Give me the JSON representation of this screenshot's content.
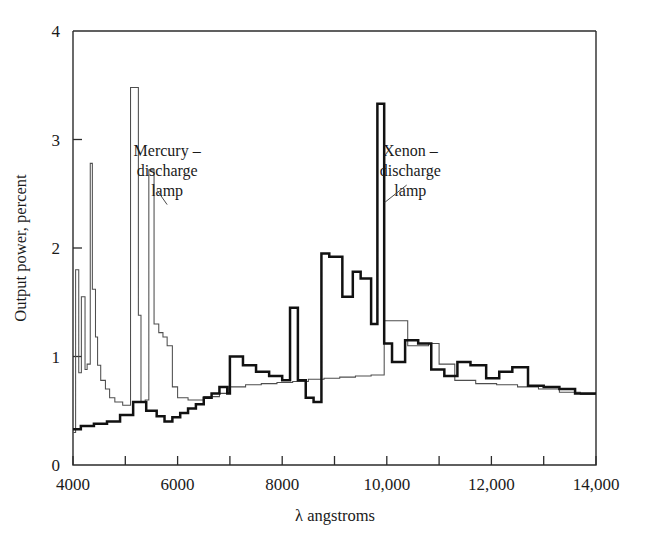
{
  "chart_data": {
    "type": "line",
    "title": "",
    "xlabel": "λ angstroms",
    "ylabel": "Output power, percent",
    "xlim": [
      4000,
      14000
    ],
    "ylim": [
      0,
      4
    ],
    "grid": false,
    "legend_position": "inline-annotations",
    "xticks": [
      4000,
      5000,
      6000,
      7000,
      8000,
      9000,
      10000,
      11000,
      12000,
      13000,
      14000
    ],
    "xtick_labels": [
      "4000",
      "",
      "6000",
      "",
      "8000",
      "",
      "10,000",
      "",
      "12,000",
      "",
      "14,000"
    ],
    "yticks": [
      0,
      1,
      2,
      3,
      4
    ],
    "ytick_labels": [
      "0",
      "1",
      "2",
      "3",
      "4"
    ],
    "annotations": [
      {
        "name": "mercury-label",
        "text_lines": [
          "Mercury –",
          "discharge",
          "lamp"
        ],
        "x": 5800,
        "y": 2.85
      },
      {
        "name": "xenon-label",
        "text_lines": [
          "Xenon –",
          "discharge",
          "lamp"
        ],
        "x": 10450,
        "y": 2.85
      }
    ],
    "series": [
      {
        "name": "Mercury-discharge lamp",
        "style": "thin",
        "color": "#4e4e4e",
        "x": [
          4000,
          4050,
          4050,
          4110,
          4110,
          4160,
          4160,
          4230,
          4230,
          4270,
          4270,
          4330,
          4330,
          4370,
          4370,
          4430,
          4430,
          4470,
          4470,
          4530,
          4530,
          4620,
          4620,
          4700,
          4700,
          4800,
          4800,
          4950,
          4950,
          5100,
          5100,
          5250,
          5250,
          5300,
          5300,
          5380,
          5380,
          5450,
          5450,
          5550,
          5550,
          5640,
          5640,
          5720,
          5720,
          5800,
          5800,
          5900,
          5900,
          6000,
          6000,
          6200,
          6200,
          6500,
          6500,
          6800,
          6800,
          7000,
          7000,
          7300,
          7300,
          7600,
          7600,
          7900,
          7900,
          8200,
          8200,
          8500,
          8500,
          8800,
          8800,
          9100,
          9100,
          9400,
          9400,
          9700,
          9700,
          9950,
          9950,
          10000,
          10000,
          10400,
          10400,
          10800,
          10800,
          11000,
          11000,
          11300,
          11300,
          11700,
          11700,
          12100,
          12100,
          12500,
          12500,
          12900,
          12900,
          13300,
          13300,
          13700,
          13700,
          14000
        ],
        "y": [
          0.3,
          0.3,
          1.8,
          1.8,
          0.85,
          0.85,
          1.55,
          1.55,
          0.88,
          0.88,
          0.93,
          0.93,
          2.78,
          2.78,
          1.62,
          1.62,
          1.18,
          1.18,
          0.92,
          0.92,
          0.78,
          0.78,
          0.7,
          0.7,
          0.62,
          0.62,
          0.58,
          0.58,
          0.55,
          0.55,
          3.48,
          3.48,
          1.38,
          1.38,
          0.58,
          0.58,
          0.6,
          0.6,
          2.72,
          2.72,
          1.3,
          1.3,
          1.22,
          1.22,
          1.18,
          1.18,
          1.1,
          1.1,
          0.72,
          0.72,
          0.62,
          0.62,
          0.6,
          0.6,
          0.63,
          0.63,
          0.66,
          0.66,
          0.72,
          0.72,
          0.74,
          0.74,
          0.75,
          0.75,
          0.76,
          0.76,
          0.77,
          0.77,
          0.79,
          0.79,
          0.8,
          0.8,
          0.81,
          0.81,
          0.82,
          0.82,
          0.83,
          0.83,
          1.33,
          1.33,
          1.33,
          1.33,
          1.1,
          1.1,
          1.12,
          1.12,
          0.93,
          0.93,
          0.78,
          0.78,
          0.75,
          0.75,
          0.74,
          0.74,
          0.72,
          0.72,
          0.7,
          0.7,
          0.67,
          0.67,
          0.65,
          0.65
        ]
      },
      {
        "name": "Xenon-discharge lamp",
        "style": "thick",
        "color": "#111111",
        "x": [
          4000,
          4150,
          4150,
          4400,
          4400,
          4650,
          4650,
          4900,
          4900,
          5150,
          5150,
          5400,
          5400,
          5600,
          5600,
          5750,
          5750,
          5900,
          5900,
          6050,
          6050,
          6200,
          6200,
          6350,
          6350,
          6500,
          6500,
          6650,
          6650,
          6800,
          6800,
          6950,
          6950,
          7000,
          7000,
          7250,
          7250,
          7500,
          7500,
          7750,
          7750,
          8000,
          8000,
          8150,
          8150,
          8300,
          8300,
          8450,
          8450,
          8600,
          8600,
          8750,
          8750,
          8900,
          8900,
          9150,
          9150,
          9350,
          9350,
          9500,
          9500,
          9700,
          9700,
          9820,
          9820,
          9950,
          9950,
          10100,
          10100,
          10350,
          10350,
          10600,
          10600,
          10850,
          10850,
          11100,
          11100,
          11350,
          11350,
          11600,
          11600,
          11900,
          11900,
          12150,
          12150,
          12400,
          12400,
          12700,
          12700,
          13000,
          13000,
          13300,
          13300,
          13600,
          13600,
          14000
        ],
        "y": [
          0.33,
          0.33,
          0.36,
          0.36,
          0.38,
          0.38,
          0.4,
          0.4,
          0.46,
          0.46,
          0.58,
          0.58,
          0.5,
          0.5,
          0.45,
          0.45,
          0.4,
          0.4,
          0.44,
          0.44,
          0.48,
          0.48,
          0.52,
          0.52,
          0.56,
          0.56,
          0.62,
          0.62,
          0.66,
          0.66,
          0.72,
          0.72,
          0.66,
          0.66,
          1.0,
          1.0,
          0.92,
          0.92,
          0.86,
          0.86,
          0.82,
          0.82,
          0.78,
          0.78,
          1.45,
          1.45,
          0.78,
          0.78,
          0.62,
          0.62,
          0.58,
          0.58,
          1.95,
          1.95,
          1.92,
          1.92,
          1.55,
          1.55,
          1.78,
          1.78,
          1.72,
          1.72,
          1.3,
          1.3,
          3.33,
          3.33,
          1.12,
          1.12,
          0.95,
          0.95,
          1.15,
          1.15,
          1.12,
          1.12,
          0.88,
          0.88,
          0.82,
          0.82,
          0.95,
          0.95,
          0.92,
          0.92,
          0.8,
          0.8,
          0.86,
          0.86,
          0.9,
          0.9,
          0.73,
          0.73,
          0.72,
          0.72,
          0.7,
          0.7,
          0.66,
          0.66
        ]
      }
    ]
  }
}
